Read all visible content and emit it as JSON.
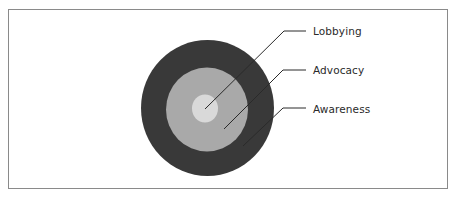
{
  "diagram": {
    "type": "concentric-circles",
    "rings": [
      {
        "name": "Lobbying",
        "level": "inner",
        "color": "#d9d9d9"
      },
      {
        "name": "Advocacy",
        "level": "middle",
        "color": "#a9a9a9"
      },
      {
        "name": "Awareness",
        "level": "outer",
        "color": "#393939"
      }
    ],
    "labels": {
      "lobbying": "Lobbying",
      "advocacy": "Advocacy",
      "awareness": "Awareness"
    },
    "colors": {
      "frame_border": "#8a8a8a",
      "leader_line": "#2a2a2a",
      "text": "#2a2a2a"
    }
  }
}
